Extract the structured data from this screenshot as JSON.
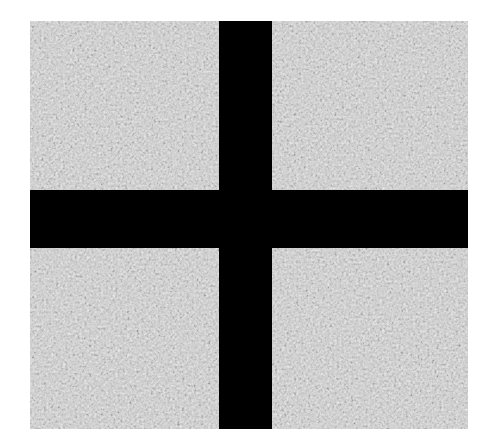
{
  "image": {
    "description": "Grayscale granular texture sample divided into four quadrants by a black cross",
    "background_color": "#ffffff",
    "texture_colors": {
      "light": "#d8d8d8",
      "mid": "#9a9a9a",
      "dark": "#202020"
    },
    "cross_color": "#000000",
    "quadrants": [
      {
        "position": "top-left"
      },
      {
        "position": "top-right"
      },
      {
        "position": "bottom-left"
      },
      {
        "position": "bottom-right"
      }
    ]
  }
}
